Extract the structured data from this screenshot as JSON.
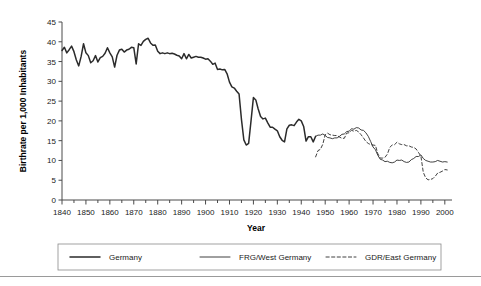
{
  "chart_data": {
    "type": "line",
    "title": "",
    "xlabel": "Year",
    "ylabel": "Birthrate per 1,000 Inhabitants",
    "xlim": [
      1840,
      2003
    ],
    "ylim": [
      0,
      45
    ],
    "xticks": [
      1840,
      1850,
      1860,
      1870,
      1880,
      1890,
      1900,
      1910,
      1920,
      1930,
      1940,
      1950,
      1960,
      1970,
      1980,
      1990,
      2000
    ],
    "xtick_labels": [
      "1840",
      "1850",
      "1860",
      "1870",
      "1880",
      "1890",
      "1900",
      "1910",
      "1920",
      "1930",
      "1940",
      "1950",
      "1960",
      "1970",
      "1980",
      "1990",
      "2000"
    ],
    "xtick_minor_step": 5,
    "yticks": [
      0,
      5,
      10,
      15,
      20,
      25,
      30,
      35,
      40,
      45
    ],
    "ytick_labels": [
      "0",
      "5",
      "10",
      "15",
      "20",
      "25",
      "30",
      "35",
      "40",
      "45"
    ],
    "grid": false,
    "legend_position": "below-plot",
    "series": [
      {
        "name": "Germany",
        "style": "solid-thick",
        "x": [
          1840,
          1841,
          1842,
          1843,
          1844,
          1845,
          1846,
          1847,
          1848,
          1849,
          1850,
          1851,
          1852,
          1853,
          1854,
          1855,
          1856,
          1857,
          1858,
          1859,
          1860,
          1861,
          1862,
          1863,
          1864,
          1865,
          1866,
          1867,
          1868,
          1869,
          1870,
          1871,
          1872,
          1873,
          1874,
          1875,
          1876,
          1877,
          1878,
          1879,
          1880,
          1881,
          1882,
          1883,
          1884,
          1885,
          1886,
          1887,
          1888,
          1889,
          1890,
          1891,
          1892,
          1893,
          1894,
          1895,
          1896,
          1897,
          1898,
          1899,
          1900,
          1901,
          1902,
          1903,
          1904,
          1905,
          1906,
          1907,
          1908,
          1909,
          1910,
          1911,
          1912,
          1913,
          1914,
          1915,
          1916,
          1917,
          1918,
          1919,
          1920,
          1921,
          1922,
          1923,
          1924,
          1925,
          1926,
          1927,
          1928,
          1929,
          1930,
          1931,
          1932,
          1933,
          1934,
          1935,
          1936,
          1937,
          1938,
          1939,
          1940,
          1941,
          1942,
          1943,
          1944,
          1945,
          1946
        ],
        "y": [
          37.8,
          38.6,
          37.2,
          38.0,
          38.9,
          37.5,
          35.4,
          33.9,
          36.3,
          39.5,
          37.2,
          36.5,
          34.7,
          35.2,
          36.5,
          34.9,
          36.0,
          36.3,
          37.1,
          38.5,
          37.2,
          36.2,
          33.6,
          36.6,
          37.9,
          38.1,
          37.4,
          37.9,
          38.1,
          38.6,
          38.5,
          34.4,
          39.5,
          39.1,
          40.1,
          40.6,
          40.9,
          39.7,
          39.1,
          39.2,
          37.6,
          37.0,
          37.2,
          37.0,
          37.2,
          37.0,
          37.1,
          36.9,
          36.6,
          36.4,
          35.7,
          37.0,
          35.7,
          36.8,
          35.9,
          36.1,
          36.3,
          36.1,
          36.1,
          35.9,
          35.6,
          35.7,
          35.1,
          34.3,
          34.6,
          33.0,
          33.1,
          32.9,
          33.0,
          31.9,
          29.8,
          28.6,
          28.3,
          27.5,
          26.8,
          20.4,
          15.2,
          13.9,
          14.3,
          20.0,
          25.9,
          25.3,
          23.0,
          21.1,
          20.5,
          20.7,
          19.5,
          18.4,
          18.4,
          17.9,
          17.5,
          16.0,
          15.1,
          14.7,
          18.0,
          18.9,
          19.0,
          18.8,
          19.7,
          20.4,
          20.0,
          18.6,
          14.9,
          16.0,
          16.0,
          14.7,
          16.1
        ]
      },
      {
        "name": "FRG/West Germany",
        "style": "solid-thin",
        "x": [
          1946,
          1947,
          1948,
          1949,
          1950,
          1951,
          1952,
          1953,
          1954,
          1955,
          1956,
          1957,
          1958,
          1959,
          1960,
          1961,
          1962,
          1963,
          1964,
          1965,
          1966,
          1967,
          1968,
          1969,
          1970,
          1971,
          1972,
          1973,
          1974,
          1975,
          1976,
          1977,
          1978,
          1979,
          1980,
          1981,
          1982,
          1983,
          1984,
          1985,
          1986,
          1987,
          1988,
          1989,
          1990,
          1991,
          1992,
          1993,
          1994,
          1995,
          1996,
          1997,
          1998,
          1999,
          2000,
          2001
        ],
        "y": [
          16.1,
          16.4,
          16.4,
          16.7,
          16.3,
          15.8,
          15.7,
          15.5,
          15.7,
          15.7,
          16.1,
          16.6,
          16.7,
          17.3,
          17.4,
          18.0,
          17.9,
          18.3,
          18.2,
          17.7,
          17.6,
          17.0,
          16.1,
          14.8,
          13.4,
          12.7,
          11.3,
          10.3,
          10.1,
          9.7,
          9.8,
          9.5,
          9.4,
          9.6,
          10.1,
          10.0,
          10.1,
          9.7,
          9.5,
          9.6,
          10.2,
          10.5,
          11.0,
          11.0,
          11.4,
          10.5,
          10.0,
          9.8,
          9.6,
          9.6,
          9.7,
          10.0,
          9.8,
          9.6,
          9.7,
          9.6
        ]
      },
      {
        "name": "GDR/East Germany",
        "style": "dashed",
        "x": [
          1946,
          1947,
          1948,
          1949,
          1950,
          1951,
          1952,
          1953,
          1954,
          1955,
          1956,
          1957,
          1958,
          1959,
          1960,
          1961,
          1962,
          1963,
          1964,
          1965,
          1966,
          1967,
          1968,
          1969,
          1970,
          1971,
          1972,
          1973,
          1974,
          1975,
          1976,
          1977,
          1978,
          1979,
          1980,
          1981,
          1982,
          1983,
          1984,
          1985,
          1986,
          1987,
          1988,
          1989,
          1990,
          1991,
          1992,
          1993,
          1994,
          1995,
          1996,
          1997,
          1998,
          1999,
          2000,
          2001
        ],
        "y": [
          10.9,
          12.5,
          12.8,
          14.1,
          16.5,
          16.9,
          16.5,
          16.4,
          16.3,
          16.3,
          15.9,
          15.6,
          15.6,
          16.9,
          17.0,
          17.6,
          17.4,
          17.6,
          17.2,
          16.5,
          15.7,
          14.8,
          14.3,
          14.0,
          13.9,
          13.8,
          11.7,
          10.6,
          10.6,
          10.8,
          11.6,
          13.3,
          13.9,
          14.0,
          14.6,
          14.2,
          14.0,
          14.0,
          13.7,
          13.7,
          13.4,
          13.3,
          12.9,
          12.0,
          11.1,
          7.0,
          5.6,
          5.1,
          5.2,
          5.4,
          6.0,
          6.8,
          7.0,
          7.3,
          7.7,
          7.6
        ]
      }
    ]
  },
  "legend": {
    "items": [
      {
        "label": "Germany",
        "style": "solid-thick"
      },
      {
        "label": "FRG/West Germany",
        "style": "solid-thin"
      },
      {
        "label": "GDR/East Germany",
        "style": "dashed"
      }
    ]
  },
  "colors": {
    "line": "#2b2b2b",
    "axis": "#4a4a4a",
    "legend_border": "#8a8a8a",
    "rule": "#9a9a9a",
    "background": "#ffffff"
  }
}
